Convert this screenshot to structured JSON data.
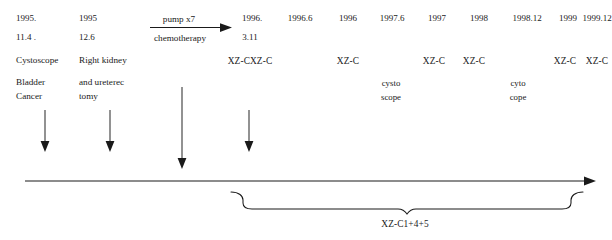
{
  "diagram": {
    "columns": [
      {
        "id": "col-1995-11-4",
        "date_line1": "1995.",
        "date_line2": "11.4 .",
        "event_line1": "Cystoscope",
        "event_line2": "Bladder",
        "event_line3": "Cancer"
      },
      {
        "id": "col-1995-12-6",
        "date_line1": "1995",
        "date_line2": "12.6",
        "event_line1": "Right kidney",
        "event_line2": "and ureterec",
        "event_line3": "tomy"
      },
      {
        "id": "col-1996-3-11",
        "date_line1": "1996.",
        "date_line2": "3.11",
        "treatment": "XZ-CXZ-C"
      }
    ],
    "chemo_arrow": {
      "above_label": "pump x7",
      "below_label": "chemotherapy"
    },
    "followups": [
      {
        "id": "fu-1996-6",
        "year": "1996.6",
        "treatment": "",
        "exam_line1": "",
        "exam_line2": ""
      },
      {
        "id": "fu-1996",
        "year": "1996",
        "treatment": "XZ-C",
        "exam_line1": "",
        "exam_line2": ""
      },
      {
        "id": "fu-1997-6",
        "year": "1997.6",
        "treatment": "",
        "exam_line1": "cysto",
        "exam_line2": "scope"
      },
      {
        "id": "fu-1997",
        "year": "1997",
        "treatment": "XZ-C",
        "exam_line1": "",
        "exam_line2": ""
      },
      {
        "id": "fu-1998",
        "year": "1998",
        "treatment": "XZ-C",
        "exam_line1": "",
        "exam_line2": ""
      },
      {
        "id": "fu-1998-12",
        "year": "1998.12",
        "treatment": "",
        "exam_line1": "cyto",
        "exam_line2": "cope"
      },
      {
        "id": "fu-1999",
        "year": "1999",
        "treatment": "XZ-C",
        "exam_line1": "",
        "exam_line2": ""
      },
      {
        "id": "fu-1999-12",
        "year": "1999.12",
        "treatment": "XZ-C",
        "exam_line1": "",
        "exam_line2": ""
      }
    ],
    "brace": {
      "label": "XZ-C1+4+5"
    },
    "colors": {
      "ink": "#1a1a1a",
      "background": "#ffffff"
    }
  }
}
